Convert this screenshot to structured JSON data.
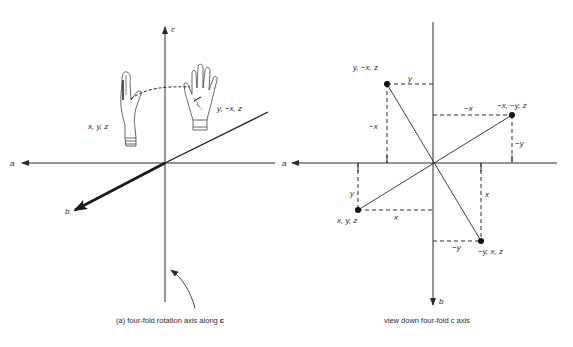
{
  "figure": {
    "left_panel": {
      "caption_prefix": "(a) four-fold rotation axis along ",
      "caption_bold": "c",
      "axis_labels": {
        "c": "c",
        "a": "a",
        "b": "b"
      },
      "hand_labels": {
        "original": "x, y, z",
        "rotated": "y, −x, z"
      }
    },
    "right_panel": {
      "caption": "view down four-fold c axis",
      "axis_labels": {
        "a": "a",
        "b": "b"
      },
      "points": [
        {
          "label": "y, −x, z",
          "dx_label": "y",
          "dy_label": "−x"
        },
        {
          "label": "−x, −y, z",
          "dx_label": "−x",
          "dy_label": "−y"
        },
        {
          "label": "x, y, z",
          "dx_label": "x",
          "dy_label": "y"
        },
        {
          "label": "−y, x, z",
          "dx_label": "−y",
          "dy_label": "x"
        }
      ]
    },
    "colors": {
      "ink": "#2a2a2a",
      "background": "#ffffff"
    }
  }
}
